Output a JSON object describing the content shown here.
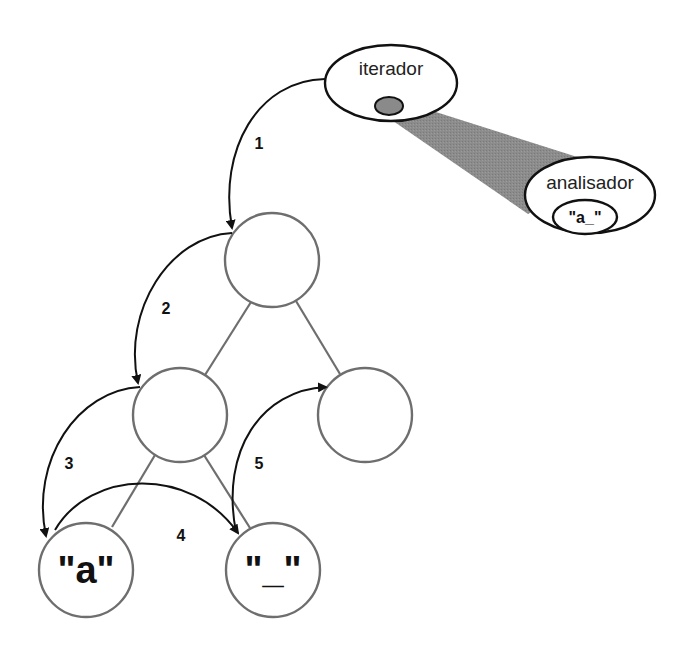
{
  "diagram": {
    "iterator": {
      "label": "iterador"
    },
    "parser": {
      "label": "analisador",
      "buffer": "\"a_\""
    },
    "tree": {
      "nodes": [
        {
          "id": "root",
          "label": ""
        },
        {
          "id": "left",
          "label": ""
        },
        {
          "id": "right",
          "label": ""
        },
        {
          "id": "leaf-a",
          "label": "\"a\""
        },
        {
          "id": "leaf-underscore",
          "label": "\"_\""
        }
      ]
    },
    "steps": [
      "1",
      "2",
      "3",
      "4",
      "5"
    ],
    "colors": {
      "shade": "#8a8a8a",
      "edge": "#6e6e6e",
      "arrow": "#111111"
    }
  }
}
